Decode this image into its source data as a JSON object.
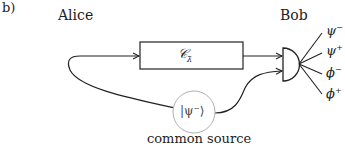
{
  "panel_label": "b)",
  "parties": {
    "alice": "Alice",
    "bob": "Bob"
  },
  "channel": {
    "symbol": "𝒞",
    "subscript": "λ̄"
  },
  "source": {
    "state": "|ψ⁻⟩",
    "label": "common source"
  },
  "outcomes": [
    {
      "base": "ψ",
      "sign": "−"
    },
    {
      "base": "ψ",
      "sign": "+"
    },
    {
      "base": "ϕ",
      "sign": "−"
    },
    {
      "base": "ϕ",
      "sign": "+"
    }
  ],
  "colors": {
    "line": "#222222",
    "source_circle": "#b0b0b0"
  }
}
